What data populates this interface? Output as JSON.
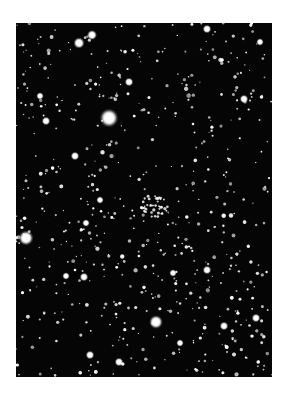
{
  "image": {
    "subject": "star field photograph with open star cluster",
    "background_color": "#ffffff",
    "sky_color": "#050505",
    "star_color": "#ffffff",
    "frame": {
      "x": 16,
      "y": 23,
      "width": 256,
      "height": 354
    }
  },
  "bright_stars": [
    {
      "x": 93,
      "y": 95,
      "r": 7.5
    },
    {
      "x": 10,
      "y": 215,
      "r": 6
    },
    {
      "x": 140,
      "y": 299,
      "r": 5.5
    },
    {
      "x": 63,
      "y": 20,
      "r": 4.5
    },
    {
      "x": 76,
      "y": 12,
      "r": 4
    },
    {
      "x": 113,
      "y": 59,
      "r": 3.5
    },
    {
      "x": 30,
      "y": 98,
      "r": 3.5
    },
    {
      "x": 191,
      "y": 6,
      "r": 3.5
    },
    {
      "x": 244,
      "y": 19,
      "r": 3
    },
    {
      "x": 59,
      "y": 133,
      "r": 3.5
    },
    {
      "x": 228,
      "y": 76,
      "r": 3.5
    },
    {
      "x": 208,
      "y": 303,
      "r": 3.5
    },
    {
      "x": 240,
      "y": 295,
      "r": 3.5
    },
    {
      "x": 191,
      "y": 247,
      "r": 3.5
    },
    {
      "x": 68,
      "y": 254,
      "r": 3.5
    },
    {
      "x": 74,
      "y": 332,
      "r": 3.5
    },
    {
      "x": 103,
      "y": 339,
      "r": 3.5
    },
    {
      "x": 24,
      "y": 73,
      "r": 3
    },
    {
      "x": 50,
      "y": 253,
      "r": 3
    },
    {
      "x": 164,
      "y": 320,
      "r": 3
    },
    {
      "x": 70,
      "y": 200,
      "r": 3
    },
    {
      "x": 157,
      "y": 250,
      "r": 3
    },
    {
      "x": 84,
      "y": 177,
      "r": 3
    }
  ],
  "cluster": {
    "cx": 138,
    "cy": 183,
    "spread": 14,
    "count": 40
  },
  "field": {
    "count": 620,
    "seed": 7
  }
}
